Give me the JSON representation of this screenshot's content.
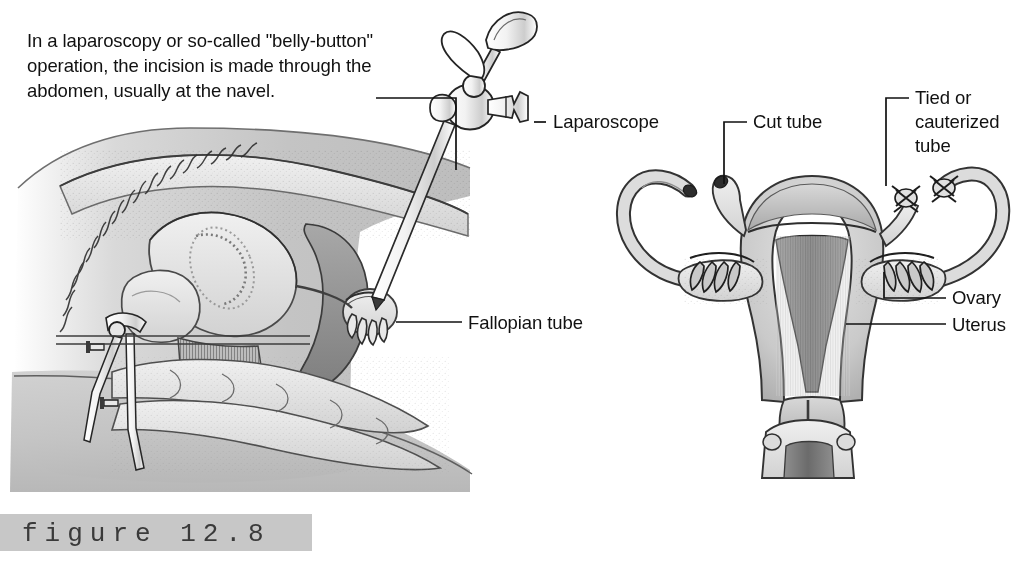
{
  "figure": {
    "number_label": "figure  12.8",
    "band_color": "#c7c7c7",
    "background_color": "#ffffff",
    "ink_color": "#111111"
  },
  "caption": {
    "text": "In a laparoscopy or so-called \"belly-button\" operation, the incision is made through the abdomen, usually at the navel."
  },
  "labels": {
    "laparoscope": "Laparoscope",
    "cut_tube": "Cut tube",
    "tied_or_cauterized_tube": "Tied or cauterized tube",
    "fallopian_tube": "Fallopian tube",
    "ovary": "Ovary",
    "uterus": "Uterus"
  },
  "panels": {
    "left": {
      "name": "sagittal-section-laparoscopy",
      "description": "Side cross-section of female pelvis showing laparoscope inserted through the navel"
    },
    "right": {
      "name": "anterior-uterus-tubal-ligation",
      "description": "Front view of uterus, fallopian tubes and ovaries after tubal ligation"
    }
  }
}
